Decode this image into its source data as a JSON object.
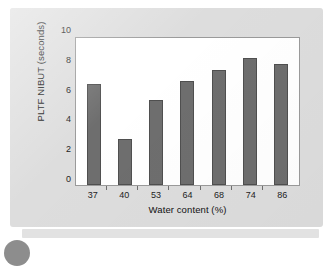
{
  "chart_data": {
    "type": "bar",
    "title": "",
    "subtitle": "",
    "xlabel": "Water content (%)",
    "ylabel": "PLTF NIBUT (seconds)",
    "categories": [
      "37",
      "40",
      "53",
      "64",
      "68",
      "74",
      "86"
    ],
    "values": [
      6.85,
      3.1,
      5.75,
      7.05,
      7.8,
      8.65,
      8.25
    ],
    "series": [
      {
        "name": "PLTF NIBUT",
        "values": [
          6.85,
          3.1,
          5.75,
          7.05,
          7.8,
          8.65,
          8.25
        ]
      }
    ],
    "ylim": [
      0,
      10
    ],
    "yticks": [
      0,
      2,
      4,
      6,
      8,
      10
    ],
    "ytick_labels": [
      "0",
      "2",
      "4",
      "6",
      "8",
      "10"
    ],
    "xtick_labels": [
      "37",
      "40",
      "53",
      "64",
      "68",
      "74",
      "86"
    ],
    "grid": false,
    "legend": false,
    "legend_position": "none",
    "bar_color": "#6e6e6e",
    "bar_edge_color": "#4f4f4f",
    "plot_background": "#ffffff",
    "figure_background": "#dddddd",
    "axis_color": "#9a9a9a",
    "text_color": "#111111"
  }
}
